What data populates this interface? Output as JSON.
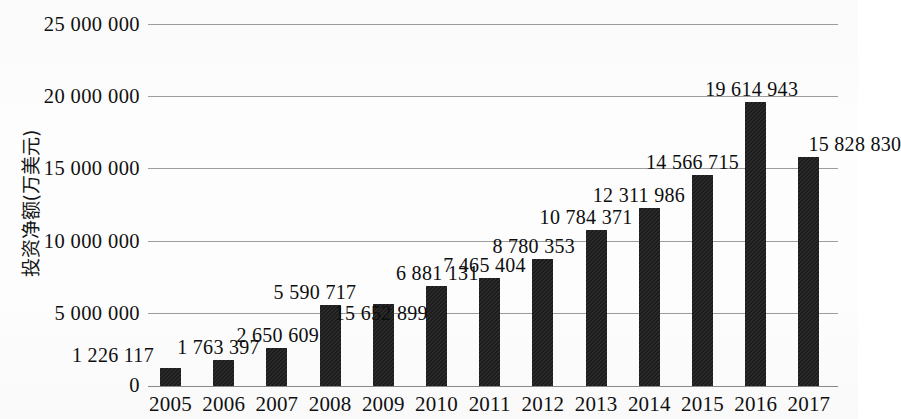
{
  "chart_data": {
    "type": "bar",
    "title": "",
    "subtitle": "",
    "xlabel": "",
    "ylabel": "投资净额(万美元)",
    "categories": [
      "2005",
      "2006",
      "2007",
      "2008",
      "2009",
      "2010",
      "2011",
      "2012",
      "2013",
      "2014",
      "2015",
      "2016",
      "2017"
    ],
    "values": [
      1226117,
      1763397,
      2650609,
      5590717,
      5652899,
      6881131,
      7465404,
      8780353,
      10784371,
      12311986,
      14566715,
      19614943,
      15828830
    ],
    "data_labels": [
      "1 226 117",
      "1 763 397",
      "2 650 609",
      "5 590 717",
      "15 652 899",
      "6 881 131",
      "7 465 404",
      "8 780 353",
      "10 784 371",
      "12 311 986",
      "14 566 715",
      "19 614 943",
      "15 828 830"
    ],
    "ylim": [
      0,
      25000000
    ],
    "ytick_values": [
      0,
      5000000,
      10000000,
      15000000,
      20000000,
      25000000
    ],
    "ytick_labels": [
      "0",
      "5 000 000",
      "10 000 000",
      "15 000 000",
      "20 000 000",
      "25 000 000"
    ],
    "grid": true,
    "legend": "none",
    "bar_color": "#1b1b1b",
    "grid_color": "#9d9d9d",
    "axis_color": "#8a8a8a"
  }
}
